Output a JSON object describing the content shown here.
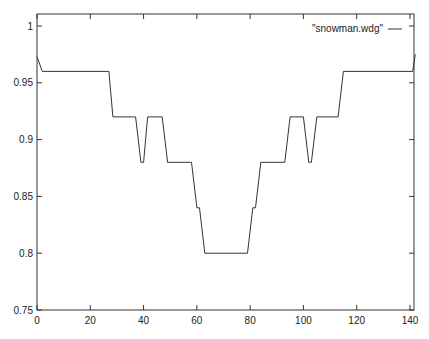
{
  "chart_data": {
    "type": "line",
    "title": "",
    "xlabel": "",
    "ylabel": "",
    "xlim": [
      0,
      142
    ],
    "ylim": [
      0.75,
      1.01
    ],
    "grid": false,
    "legend_position": "top-right",
    "x_ticks": [
      0,
      20,
      40,
      60,
      80,
      100,
      120,
      140
    ],
    "x_tick_labels": [
      "0",
      "20",
      "40",
      "60",
      "80",
      "100",
      "120",
      "140"
    ],
    "y_ticks": [
      0.75,
      0.8,
      0.85,
      0.9,
      0.95,
      1
    ],
    "y_tick_labels": [
      "0.75",
      "0.8",
      "0.85",
      "0.9",
      "0.95",
      "1"
    ],
    "series": [
      {
        "name": "\"snowman.wdg\"",
        "color": "#333333",
        "x": [
          0,
          2,
          27,
          28.5,
          37,
          39,
          40,
          41.5,
          47,
          49,
          58,
          60,
          61,
          63,
          79,
          81,
          82,
          84,
          93,
          95,
          100,
          102,
          103,
          105,
          113,
          115,
          141,
          142
        ],
        "y": [
          0.973,
          0.96,
          0.96,
          0.92,
          0.92,
          0.88,
          0.88,
          0.92,
          0.92,
          0.88,
          0.88,
          0.84,
          0.84,
          0.8,
          0.8,
          0.84,
          0.84,
          0.88,
          0.88,
          0.92,
          0.92,
          0.88,
          0.88,
          0.92,
          0.92,
          0.96,
          0.96,
          0.975
        ]
      }
    ]
  }
}
